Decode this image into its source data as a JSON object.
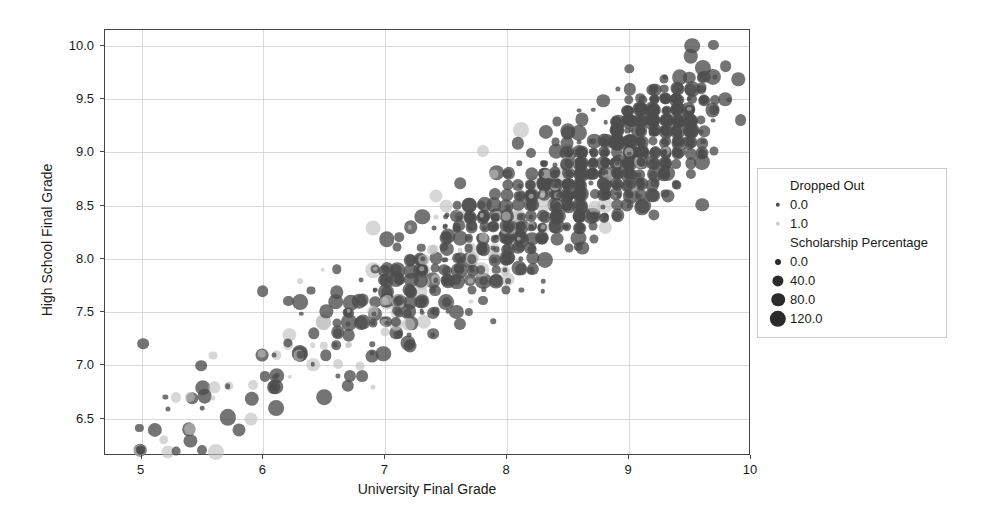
{
  "chart_data": {
    "type": "scatter",
    "title": "",
    "xlabel": "University Final Grade",
    "ylabel": "High School Final Grade",
    "xlim": [
      4.7,
      10.0
    ],
    "ylim": [
      6.15,
      10.15
    ],
    "xticks": [
      "5",
      "6",
      "7",
      "8",
      "9",
      "10"
    ],
    "xtick_values": [
      5,
      6,
      7,
      8,
      9,
      10
    ],
    "yticks": [
      "6.5",
      "7.0",
      "7.5",
      "8.0",
      "8.5",
      "9.0",
      "9.5",
      "10.0"
    ],
    "ytick_values": [
      6.5,
      7.0,
      7.5,
      8.0,
      8.5,
      9.0,
      9.5,
      10.0
    ],
    "grid": true,
    "legend_position": "right",
    "hue_name": "Dropped Out",
    "size_name": "Scholarship Percentage",
    "hue_levels": [
      "0.0",
      "1.0"
    ],
    "hue_colors": [
      "#4d4d4d",
      "#bfbfbf"
    ],
    "size_levels": [
      "0.0",
      "40.0",
      "80.0",
      "120.0"
    ],
    "size_radii_px": [
      2.2,
      4.6,
      6.2,
      7.6
    ],
    "marker_opacity": 0.75,
    "point_count": 1000
  },
  "legend": {
    "hue_title": "Dropped Out",
    "hue_items": [
      {
        "label": "0.0",
        "color": "#4d4d4d",
        "radius": 2.2
      },
      {
        "label": "1.0",
        "color": "#cccccc",
        "radius": 2.2
      }
    ],
    "size_title": "Scholarship Percentage",
    "size_items": [
      {
        "label": "0.0",
        "color": "#2b2b2b",
        "radius": 3.0
      },
      {
        "label": "40.0",
        "color": "#2b2b2b",
        "radius": 5.6
      },
      {
        "label": "80.0",
        "color": "#2b2b2b",
        "radius": 6.8
      },
      {
        "label": "120.0",
        "color": "#2b2b2b",
        "radius": 8.2
      }
    ]
  },
  "colors": {
    "background": "#ffffff",
    "axis": "#444444",
    "grid": "#d9d9d9",
    "text": "#1a1a1a",
    "legend_border": "#cccccc"
  }
}
